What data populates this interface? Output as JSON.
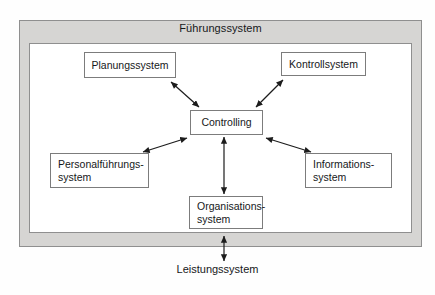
{
  "diagram": {
    "frame": {
      "title": "Führungssystem"
    },
    "external_label": "Leistungssystem",
    "nodes": [
      {
        "id": "planungssystem",
        "label": "Planungssystem"
      },
      {
        "id": "kontrollsystem",
        "label": "Kontrollsystem"
      },
      {
        "id": "controlling",
        "label": "Controlling"
      },
      {
        "id": "personalfuehrungssystem",
        "label": "Personalführungs-\nsystem"
      },
      {
        "id": "informationssystem",
        "label": "Informations-\nsystem"
      },
      {
        "id": "organisationssystem",
        "label": "Organisations-\nsystem"
      }
    ],
    "connections": [
      {
        "from": "planungssystem",
        "to": "controlling",
        "style": "double-arrow"
      },
      {
        "from": "kontrollsystem",
        "to": "controlling",
        "style": "double-arrow"
      },
      {
        "from": "personalfuehrungssystem",
        "to": "controlling",
        "style": "double-arrow"
      },
      {
        "from": "informationssystem",
        "to": "controlling",
        "style": "double-arrow"
      },
      {
        "from": "organisationssystem",
        "to": "controlling",
        "style": "double-arrow"
      },
      {
        "from": "leistungssystem",
        "to": "fuehrungssystem",
        "style": "double-arrow"
      }
    ],
    "colors": {
      "frame_fill": "#d6d5d3",
      "frame_stroke": "#8f8f8f",
      "node_fill": "#ffffff",
      "node_stroke": "#7c7c7c",
      "arrow_stroke": "#1c1c1c",
      "text": "#16181a",
      "canvas": "#fefefe"
    }
  }
}
